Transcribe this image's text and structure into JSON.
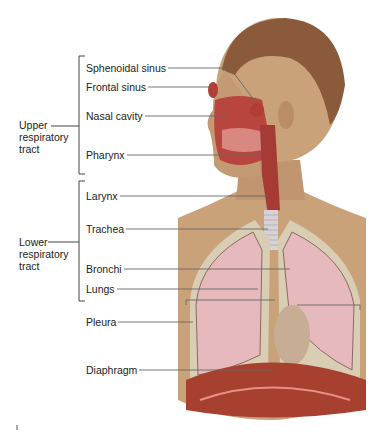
{
  "figure": {
    "groups": [
      {
        "id": "upper",
        "lines": [
          "Upper",
          "respiratory",
          "tract"
        ]
      },
      {
        "id": "lower",
        "lines": [
          "Lower",
          "respiratory",
          "tract"
        ]
      }
    ],
    "labels": [
      {
        "id": "sphenoidal-sinus",
        "text": "Sphenoidal sinus",
        "group": "upper"
      },
      {
        "id": "frontal-sinus",
        "text": "Frontal sinus",
        "group": "upper"
      },
      {
        "id": "nasal-cavity",
        "text": "Nasal cavity",
        "group": "upper"
      },
      {
        "id": "pharynx",
        "text": "Pharynx",
        "group": "upper"
      },
      {
        "id": "larynx",
        "text": "Larynx",
        "group": "lower"
      },
      {
        "id": "trachea",
        "text": "Trachea",
        "group": "lower"
      },
      {
        "id": "bronchi",
        "text": "Bronchi",
        "group": "lower"
      },
      {
        "id": "lungs",
        "text": "Lungs",
        "group": "lower"
      },
      {
        "id": "pleura",
        "text": "Pleura",
        "group": null
      },
      {
        "id": "diaphragm",
        "text": "Diaphragm",
        "group": null
      }
    ],
    "colors": {
      "skin": "#c9a27a",
      "hair": "#8a5a3a",
      "tissue": "#b8463f",
      "lung": "#e6b9bd",
      "pleura": "#d9cdb4",
      "diaphragm": "#a8402f",
      "leader_line": "#666666"
    }
  }
}
